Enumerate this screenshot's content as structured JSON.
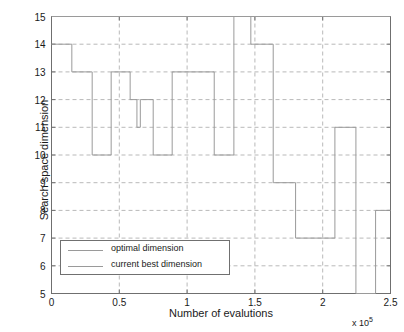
{
  "chart_data": {
    "type": "line",
    "title": "",
    "xlabel": "Number of evalutions",
    "ylabel": "Search space dimension",
    "x_multiplier": "x 10",
    "x_multiplier_exp": "5",
    "xlim": [
      0,
      2.5
    ],
    "ylim": [
      5,
      15
    ],
    "xticks": [
      0,
      0.5,
      1,
      1.5,
      2,
      2.5
    ],
    "xticklabels": [
      "0",
      "0.5",
      "1",
      "1.5",
      "2",
      "2.5"
    ],
    "yticks": [
      5,
      6,
      7,
      8,
      9,
      10,
      11,
      12,
      13,
      14,
      15
    ],
    "yticklabels": [
      "5",
      "6",
      "7",
      "8",
      "9",
      "10",
      "11",
      "12",
      "13",
      "14",
      "15"
    ],
    "grid": true,
    "grid_style": "dashed",
    "legend_position": "lower-left",
    "series": [
      {
        "name": "optimal dimension",
        "color": "#9a9a9a",
        "type": "step",
        "points": [
          [
            0.0,
            15
          ],
          [
            2.5,
            15
          ]
        ]
      },
      {
        "name": "current best dimension",
        "color": "#9a9a9a",
        "type": "step",
        "points": [
          [
            0.0,
            14
          ],
          [
            0.15,
            14
          ],
          [
            0.15,
            13
          ],
          [
            0.3,
            13
          ],
          [
            0.3,
            10
          ],
          [
            0.44,
            10
          ],
          [
            0.44,
            13
          ],
          [
            0.58,
            13
          ],
          [
            0.58,
            12
          ],
          [
            0.63,
            12
          ],
          [
            0.63,
            11
          ],
          [
            0.655,
            11
          ],
          [
            0.655,
            12
          ],
          [
            0.75,
            12
          ],
          [
            0.75,
            10
          ],
          [
            0.89,
            10
          ],
          [
            0.89,
            13
          ],
          [
            1.2,
            13
          ],
          [
            1.2,
            10
          ],
          [
            1.345,
            10
          ],
          [
            1.345,
            15
          ],
          [
            1.47,
            15
          ],
          [
            1.47,
            14
          ],
          [
            1.635,
            14
          ],
          [
            1.635,
            9
          ],
          [
            1.8,
            9
          ],
          [
            1.8,
            7
          ],
          [
            2.09,
            7
          ],
          [
            2.09,
            11
          ],
          [
            2.245,
            11
          ],
          [
            2.245,
            5
          ],
          [
            2.39,
            5
          ],
          [
            2.39,
            8
          ],
          [
            2.5,
            8
          ]
        ]
      }
    ]
  },
  "legend": {
    "items": [
      {
        "label": "optimal dimension"
      },
      {
        "label": "current best dimension"
      }
    ]
  }
}
